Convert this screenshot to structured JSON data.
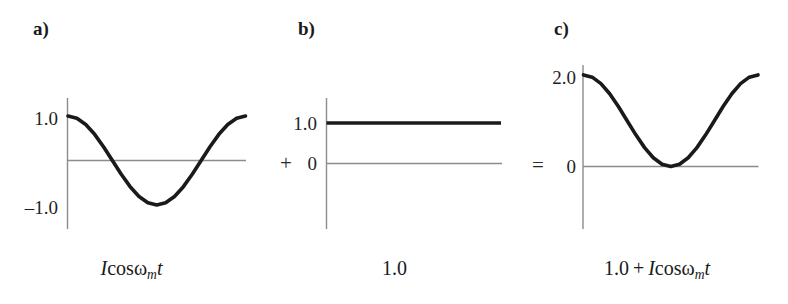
{
  "figure": {
    "background": "#ffffff",
    "curve_color": "#1a1a1a",
    "axis_color": "#8c8c8c"
  },
  "panels": [
    {
      "id": "a",
      "label": "a)",
      "operator": "",
      "tick_labels": [
        {
          "text": "1.0",
          "value": 1.0
        },
        {
          "text": "–1.0",
          "value": -1.0
        }
      ],
      "caption": {
        "parts": [
          {
            "text": "I",
            "style": "var"
          },
          {
            "text": "cos",
            "style": "up"
          },
          {
            "text": "ω",
            "style": "omega"
          },
          {
            "text": "m",
            "style": "sub"
          },
          {
            "text": "t",
            "style": "var"
          }
        ],
        "plain": "Icosωmt"
      }
    },
    {
      "id": "b",
      "label": "b)",
      "operator": "+",
      "tick_labels": [
        {
          "text": "1.0",
          "value": 1.0
        },
        {
          "text": "0",
          "value": 0.0
        }
      ],
      "caption": {
        "parts": [
          {
            "text": "1.0",
            "style": "up"
          }
        ],
        "plain": "1.0"
      }
    },
    {
      "id": "c",
      "label": "c)",
      "operator": "=",
      "tick_labels": [
        {
          "text": "2.0",
          "value": 2.0
        },
        {
          "text": "0",
          "value": 0.0
        }
      ],
      "caption": {
        "parts": [
          {
            "text": "1.0",
            "style": "up"
          },
          {
            "text": " + ",
            "style": "op"
          },
          {
            "text": "I",
            "style": "var"
          },
          {
            "text": "cos",
            "style": "up"
          },
          {
            "text": "ω",
            "style": "omega"
          },
          {
            "text": "m",
            "style": "sub"
          },
          {
            "text": "t",
            "style": "var"
          }
        ],
        "plain": "1.0 + Icosωmt"
      }
    }
  ],
  "chart_data": [
    {
      "type": "line",
      "panel": "a",
      "title": "a)",
      "expression": "I cos(ω_m t)",
      "xlabel": "",
      "ylabel": "",
      "ylim": [
        -1.45,
        1.45
      ],
      "yticks": [
        1.0,
        -1.0
      ],
      "ytick_labels": [
        "1.0",
        "–1.0"
      ],
      "grid": false,
      "legend": null,
      "baseline_value": 0.0,
      "x": [
        0,
        0.05,
        0.1,
        0.15,
        0.2,
        0.25,
        0.3,
        0.35,
        0.4,
        0.45,
        0.5,
        0.55,
        0.6,
        0.65,
        0.7,
        0.75,
        0.8,
        0.85,
        0.9,
        0.95,
        1.0
      ],
      "values": [
        1.0,
        0.951,
        0.809,
        0.588,
        0.309,
        0.0,
        -0.309,
        -0.588,
        -0.809,
        -0.951,
        -1.0,
        -0.951,
        -0.809,
        -0.588,
        -0.309,
        0.0,
        0.309,
        0.588,
        0.809,
        0.951,
        1.0
      ]
    },
    {
      "type": "line",
      "panel": "b",
      "title": "b)",
      "expression": "1.0",
      "xlabel": "",
      "ylabel": "",
      "ylim": [
        -1.45,
        1.45
      ],
      "yticks": [
        1.0,
        0.0
      ],
      "ytick_labels": [
        "1.0",
        "0"
      ],
      "grid": false,
      "legend": null,
      "baseline_value": 0.0,
      "x": [
        0,
        1.0
      ],
      "values": [
        1.0,
        1.0
      ]
    },
    {
      "type": "line",
      "panel": "c",
      "title": "c)",
      "expression": "1.0 + I cos(ω_m t)",
      "xlabel": "",
      "ylabel": "",
      "ylim": [
        -1.45,
        2.45
      ],
      "yticks": [
        2.0,
        0.0
      ],
      "ytick_labels": [
        "2.0",
        "0"
      ],
      "grid": false,
      "legend": null,
      "baseline_value": 0.0,
      "x": [
        0,
        0.05,
        0.1,
        0.15,
        0.2,
        0.25,
        0.3,
        0.35,
        0.4,
        0.45,
        0.5,
        0.55,
        0.6,
        0.65,
        0.7,
        0.75,
        0.8,
        0.85,
        0.9,
        0.95,
        1.0
      ],
      "values": [
        2.0,
        1.951,
        1.809,
        1.588,
        1.309,
        1.0,
        0.691,
        0.412,
        0.191,
        0.049,
        0.0,
        0.049,
        0.191,
        0.412,
        0.691,
        1.0,
        1.309,
        1.588,
        1.809,
        1.951,
        2.0
      ]
    }
  ]
}
